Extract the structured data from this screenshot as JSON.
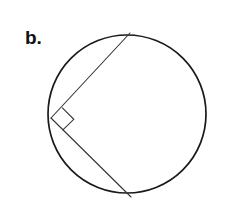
{
  "figure": {
    "label": "b.",
    "background_color": "#ffffff",
    "stroke_color": "#1a1a1a",
    "chord_color": "#333333",
    "width": 225,
    "height": 206
  },
  "chart_data": {
    "type": "diagram",
    "title": "b.",
    "subtitle": "",
    "xlabel": "",
    "ylabel": "",
    "shapes": [
      {
        "name": "circle",
        "type": "circle",
        "cx": 127,
        "cy": 114,
        "r": 79,
        "stroke": "#1a1a1a",
        "stroke_width": 1.7,
        "fill": "none"
      },
      {
        "name": "chord-upper",
        "type": "line",
        "x1": 51,
        "y1": 118,
        "x2": 130,
        "y2": 33,
        "stroke": "#333333",
        "stroke_width": 1.1
      },
      {
        "name": "chord-lower",
        "type": "line",
        "x1": 51,
        "y1": 118,
        "x2": 131,
        "y2": 197,
        "stroke": "#333333",
        "stroke_width": 1.1
      },
      {
        "name": "right-angle-marker",
        "type": "polyline",
        "points": "62.1,107.6 73.8,119.3 62.6,130.2",
        "stroke": "#333333",
        "stroke_width": 1.1,
        "fill": "none"
      }
    ],
    "annotations": [
      {
        "name": "figure-label",
        "text": "b.",
        "x": 25,
        "y": 46,
        "bold": true,
        "font_size": 19
      }
    ],
    "vertices": [
      {
        "name": "right-angle-vertex",
        "x": 51,
        "y": 118
      },
      {
        "name": "upper-chord-endpoint",
        "x": 130,
        "y": 33
      },
      {
        "name": "lower-chord-endpoint",
        "x": 131,
        "y": 197
      }
    ],
    "grid": false,
    "legend": null
  }
}
